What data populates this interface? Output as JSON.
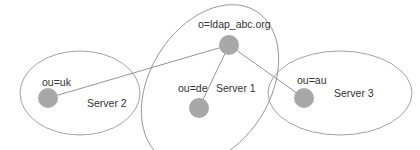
{
  "diagram": {
    "type": "ldap-topology",
    "colors": {
      "outline": "#8a8a8a",
      "edge": "#7a7a7a",
      "node_fill": "#a8a8a8",
      "text": "#333333",
      "background": "#ffffff"
    },
    "servers": [
      {
        "id": "server2",
        "label": "Server 2"
      },
      {
        "id": "server1",
        "label": "Server 1"
      },
      {
        "id": "server3",
        "label": "Server 3"
      }
    ],
    "nodes": [
      {
        "id": "root",
        "label": "o=ldap_abc.org",
        "server": "server1"
      },
      {
        "id": "uk",
        "label": "ou=uk",
        "server": "server2"
      },
      {
        "id": "de",
        "label": "ou=de",
        "server": "server1"
      },
      {
        "id": "au",
        "label": "ou=au",
        "server": "server3"
      }
    ],
    "edges": [
      {
        "from": "root",
        "to": "uk"
      },
      {
        "from": "root",
        "to": "de"
      },
      {
        "from": "root",
        "to": "au"
      }
    ]
  }
}
